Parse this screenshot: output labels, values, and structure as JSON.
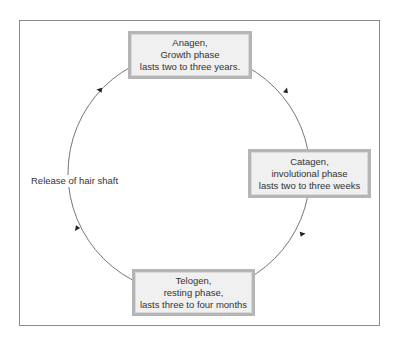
{
  "diagram": {
    "type": "cycle",
    "direction": "clockwise",
    "phases": [
      {
        "id": "anagen",
        "lines": [
          "Anagen,",
          "Growth phase",
          "lasts two to three years."
        ]
      },
      {
        "id": "catagen",
        "lines": [
          "Catagen,",
          "involutional phase",
          "lasts two to three weeks"
        ]
      },
      {
        "id": "telogen",
        "lines": [
          "Telogen,",
          "resting phase,",
          "lasts three to four months"
        ]
      }
    ],
    "side_label": "Release of hair shaft",
    "colors": {
      "box_fill": "#f0f0f0",
      "box_border": "#b5b5b5",
      "line": "#666666",
      "text": "#333333",
      "frame": "#8a8a8a"
    }
  }
}
